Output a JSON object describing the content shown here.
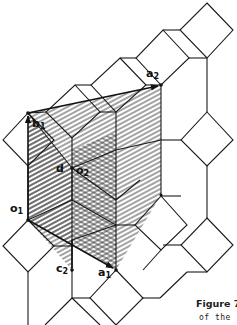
{
  "figure": {
    "caption_line1": "Figure 7.",
    "caption_line2": "of  the",
    "labels": {
      "a1": {
        "base": "a",
        "sub": "1"
      },
      "a2": {
        "base": "a",
        "sub": "2"
      },
      "b1": {
        "base": "b",
        "sub": "1"
      },
      "c2": {
        "base": "c",
        "sub": "2"
      },
      "o1": {
        "base": "o",
        "sub": "1"
      },
      "o2": {
        "base": "o",
        "sub": "2"
      },
      "d": {
        "base": "d"
      }
    },
    "colors": {
      "line": "#1a1a1a",
      "hatch": "#333333",
      "background": "#ffffff"
    }
  }
}
